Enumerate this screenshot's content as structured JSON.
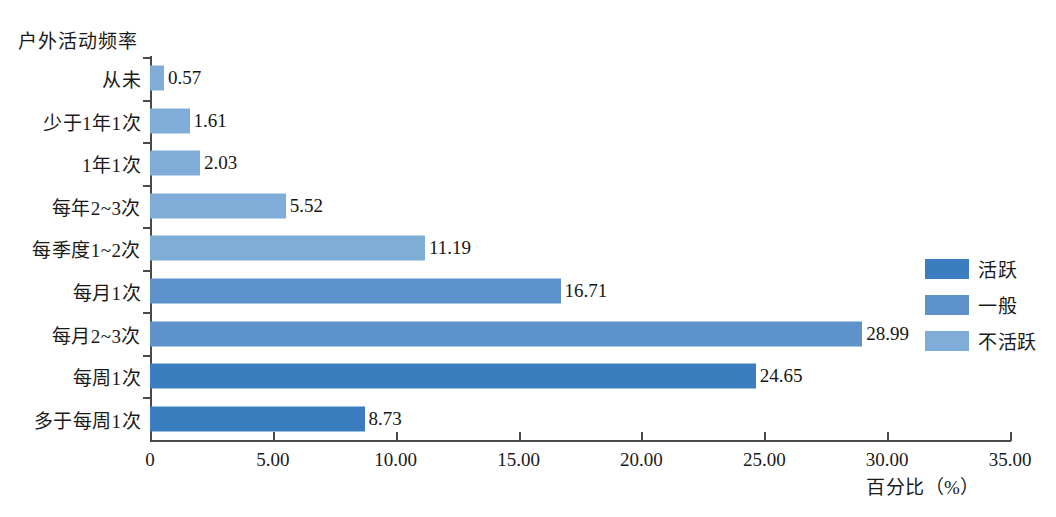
{
  "chart_data": {
    "type": "bar",
    "orientation": "horizontal",
    "title": "",
    "ylabel": "户外活动频率",
    "xlabel": "百分比（%）",
    "xlim": [
      0,
      35
    ],
    "xticks": [
      "0",
      "5.00",
      "10.00",
      "15.00",
      "20.00",
      "25.00",
      "30.00",
      "35.00"
    ],
    "xtick_values": [
      0,
      5,
      10,
      15,
      20,
      25,
      30,
      35
    ],
    "grid": false,
    "legend_position": "right",
    "categories": [
      "从未",
      "少于1年1次",
      "1年1次",
      "每年2~3次",
      "每季度1~2次",
      "每月1次",
      "每月2~3次",
      "每周1次",
      "多于每周1次"
    ],
    "values": [
      0.57,
      1.61,
      2.03,
      5.52,
      11.19,
      16.71,
      28.99,
      24.65,
      8.73
    ],
    "value_labels": [
      "0.57",
      "1.61",
      "2.03",
      "5.52",
      "11.19",
      "16.71",
      "28.99",
      "24.65",
      "8.73"
    ],
    "bar_groups": [
      "不活跃",
      "不活跃",
      "不活跃",
      "不活跃",
      "不活跃",
      "一般",
      "一般",
      "活跃",
      "活跃"
    ],
    "bar_colors": [
      "#7fadd8",
      "#7fadd8",
      "#7fadd8",
      "#7fadd8",
      "#7fadd8",
      "#5d92cb",
      "#5d92cb",
      "#3b7ebf",
      "#3b7ebf"
    ],
    "legend": [
      {
        "label": "活跃",
        "color": "#3b7ebf"
      },
      {
        "label": "一般",
        "color": "#5d92cb"
      },
      {
        "label": "不活跃",
        "color": "#7fadd8"
      }
    ]
  }
}
